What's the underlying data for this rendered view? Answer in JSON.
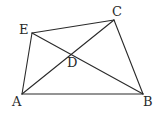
{
  "diagram": {
    "type": "geometry",
    "stroke_color": "#2a2a2a",
    "background": "#ffffff",
    "points": {
      "A": {
        "label": "A",
        "x": 22,
        "y": 94,
        "label_x": 12,
        "label_y": 106
      },
      "B": {
        "label": "B",
        "x": 143,
        "y": 94,
        "label_x": 143,
        "label_y": 106
      },
      "C": {
        "label": "C",
        "x": 114,
        "y": 20,
        "label_x": 112,
        "label_y": 16
      },
      "E": {
        "label": "E",
        "x": 32,
        "y": 33,
        "label_x": 19,
        "label_y": 34
      },
      "D": {
        "label": "D",
        "x": 71,
        "y": 54,
        "label_x": 67,
        "label_y": 67
      }
    },
    "segments": [
      {
        "name": "AB",
        "from": "A",
        "to": "B"
      },
      {
        "name": "BC",
        "from": "B",
        "to": "C"
      },
      {
        "name": "CE",
        "from": "C",
        "to": "E"
      },
      {
        "name": "EA",
        "from": "E",
        "to": "A"
      },
      {
        "name": "AC",
        "from": "A",
        "to": "C"
      },
      {
        "name": "EB",
        "from": "E",
        "to": "B"
      }
    ]
  }
}
